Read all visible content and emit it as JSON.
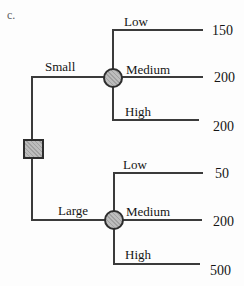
{
  "figure_label": "c.",
  "palette": {
    "background": "#fdfdfd",
    "node_fill": "#b4b4b4",
    "node_border": "#2d2d2d",
    "line_color": "#3b3b3b",
    "text_color": "#151515"
  },
  "tree": {
    "type": "decision-tree",
    "root": {
      "node": "decision-square"
    },
    "branches": [
      {
        "label": "Small",
        "node": "chance-circle",
        "outcomes": [
          {
            "label": "Low",
            "value": "150"
          },
          {
            "label": "Medium",
            "value": "200"
          },
          {
            "label": "High",
            "value": "200"
          }
        ]
      },
      {
        "label": "Large",
        "node": "chance-circle",
        "outcomes": [
          {
            "label": "Low",
            "value": "50"
          },
          {
            "label": "Medium",
            "value": "200"
          },
          {
            "label": "High",
            "value": "500"
          }
        ]
      }
    ]
  }
}
